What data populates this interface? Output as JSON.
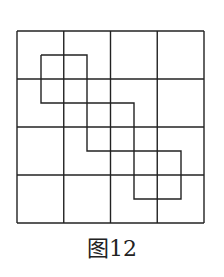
{
  "figure": {
    "caption": "图12",
    "grid": {
      "rows": 4,
      "cols": 4,
      "x0": 17,
      "y0": 31,
      "x1": 204,
      "y1": 223
    },
    "stroke_color": "#222222",
    "shaded_path": {
      "description": "staircase of three half-offset squares",
      "points": [
        [
          41,
          55
        ],
        [
          87,
          55
        ],
        [
          87,
          103
        ],
        [
          134,
          103
        ],
        [
          134,
          151
        ],
        [
          181,
          151
        ],
        [
          181,
          199
        ],
        [
          134,
          199
        ],
        [
          134,
          151
        ],
        [
          87,
          151
        ],
        [
          87,
          103
        ],
        [
          41,
          103
        ]
      ]
    }
  }
}
